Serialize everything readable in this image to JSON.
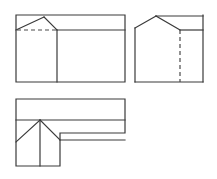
{
  "sheet": {
    "width": 217,
    "height": 179,
    "background_color": "#ffffff",
    "line_color": "#3a3a3a",
    "hidden_line_color": "#4a4a4a",
    "solid_line_width": 1.2,
    "hidden_line_width": 1.2,
    "hidden_dash_pattern": "4,3"
  },
  "drawing": {
    "kind": "orthographic-projection",
    "view_count": 3,
    "subject": "L-shaped building with gable and hip roof"
  },
  "views": [
    {
      "id": "front-elevation",
      "name": "front-elevation-view",
      "position": "top-left",
      "bounds": {
        "x": 16,
        "y": 15,
        "width": 109,
        "height": 67
      },
      "outline": "16,15 125,15 125,82 16,82",
      "solid_lines": [
        {
          "name": "outer-rectangle",
          "points": "16,15 125,15 125,82 16,82 16,15"
        },
        {
          "name": "gable-left-slope",
          "points": "16,30 44,17"
        },
        {
          "name": "gable-right-slope",
          "points": "44,17 57,30"
        },
        {
          "name": "eave-line-right",
          "points": "57,30 125,30"
        },
        {
          "name": "wall-division-vertical",
          "points": "57,30 57,82"
        }
      ],
      "hidden_lines": [
        {
          "name": "eave-line-hidden-left",
          "points": "16,30 57,30"
        }
      ]
    },
    {
      "id": "side-elevation",
      "name": "side-elevation-view",
      "position": "top-right",
      "bounds": {
        "x": 135,
        "y": 15,
        "width": 68,
        "height": 67
      },
      "outline": "135,15 203,15 203,82 135,82",
      "solid_lines": [
        {
          "name": "base-line",
          "points": "135,82 203,82"
        },
        {
          "name": "left-wall-vertical",
          "points": "135,28 135,82"
        },
        {
          "name": "right-wall-vertical",
          "points": "203,15 203,82"
        },
        {
          "name": "ridge-top-line",
          "points": "156,16 203,16"
        },
        {
          "name": "gable-left-slope",
          "points": "135,28 156,16"
        },
        {
          "name": "gable-right-slope",
          "points": "156,16 180,30"
        },
        {
          "name": "eave-line-right",
          "points": "180,30 203,30"
        }
      ],
      "hidden_lines": [
        {
          "name": "wall-division-hidden-vertical",
          "points": "180,30 180,82"
        }
      ]
    },
    {
      "id": "plan-view",
      "name": "plan-view",
      "position": "bottom-left",
      "bounds": {
        "x": 16,
        "y": 99,
        "width": 109,
        "height": 67
      },
      "outline": "16,99 125,99 125,133 60,133 60,166 16,166",
      "solid_lines": [
        {
          "name": "outline-l-shape",
          "points": "16,99 125,99 125,133 60,133 60,166 16,166 16,99"
        },
        {
          "name": "ridge-line-horizontal",
          "points": "16,120 125,120"
        },
        {
          "name": "hip-left-diagonal",
          "points": "40,120 16,142"
        },
        {
          "name": "hip-right-diagonal",
          "points": "40,120 60,140"
        },
        {
          "name": "hip-ridge-vertical",
          "points": "40,120 40,166"
        },
        {
          "name": "wing-eave-line",
          "points": "60,140 125,140"
        }
      ],
      "hidden_lines": []
    }
  ]
}
